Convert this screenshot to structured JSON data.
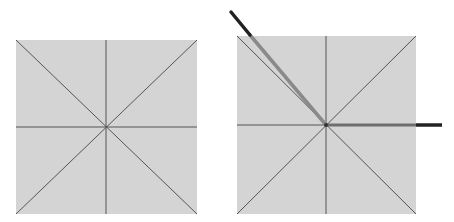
{
  "figure": {
    "colors": {
      "background": "#ffffff",
      "square_fill": "#d4d4d4",
      "line": "#555555",
      "rod_dark": "#222222",
      "rod_light": "#8a8a8a"
    },
    "panels": [
      {
        "id": "left",
        "square": {
          "x": 16,
          "y": 40,
          "w": 181,
          "h": 174
        },
        "center": [
          106,
          127
        ],
        "rods": []
      },
      {
        "id": "right",
        "square": {
          "x": 237,
          "y": 36,
          "w": 179,
          "h": 178
        },
        "center": [
          326,
          125
        ],
        "rods": [
          {
            "name": "diagonal-rod",
            "from": [
              326,
              125
            ],
            "to": [
              230,
              12
            ]
          },
          {
            "name": "horizontal-rod",
            "from": [
              326,
              125
            ],
            "to": [
              442,
              125
            ]
          }
        ]
      }
    ]
  }
}
